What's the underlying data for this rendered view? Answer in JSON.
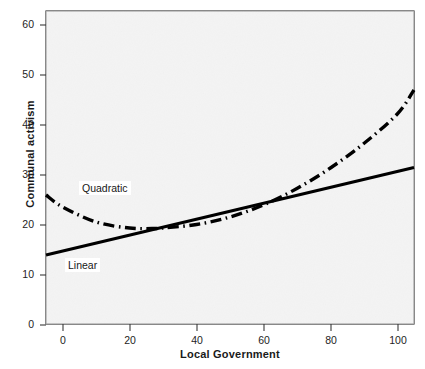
{
  "chart_data": {
    "type": "line",
    "title": "",
    "xlabel": "Local Government",
    "ylabel": "Communal activism",
    "xlim": [
      -5,
      105
    ],
    "ylim": [
      0,
      63
    ],
    "xticks": [
      0,
      20,
      40,
      60,
      80,
      100
    ],
    "yticks": [
      0,
      10,
      20,
      30,
      40,
      50,
      60
    ],
    "xtick_labels": [
      "0",
      "20",
      "40",
      "60",
      "80",
      "100"
    ],
    "ytick_labels": [
      "0",
      "10",
      "20",
      "30",
      "40",
      "50",
      "60"
    ],
    "grid": false,
    "legend_position": "inline-annotations",
    "plot_background": "#e7e7e7",
    "line_color": "#000000",
    "series": [
      {
        "name": "Linear",
        "style": "solid",
        "annotation": "Linear",
        "x": [
          -5,
          0,
          10,
          20,
          30,
          40,
          50,
          60,
          70,
          80,
          90,
          100,
          105
        ],
        "values": [
          14.0,
          14.8,
          16.4,
          18.0,
          19.6,
          21.2,
          22.8,
          24.4,
          26.0,
          27.6,
          29.2,
          30.8,
          31.5
        ]
      },
      {
        "name": "Quadratic",
        "style": "dash-dot",
        "annotation": "Quadratic",
        "x": [
          -5,
          0,
          10,
          20,
          28,
          30,
          40,
          50,
          60,
          70,
          80,
          90,
          100,
          105
        ],
        "values": [
          26.0,
          23.6,
          20.6,
          19.4,
          19.3,
          19.4,
          20.1,
          21.6,
          24.0,
          27.3,
          31.4,
          36.3,
          42.2,
          47.0
        ]
      }
    ]
  },
  "annotations": {
    "quadratic_label": "Quadratic",
    "linear_label": "Linear"
  },
  "axes": {
    "x_title": "Local Government",
    "y_title": "Communal activism"
  }
}
